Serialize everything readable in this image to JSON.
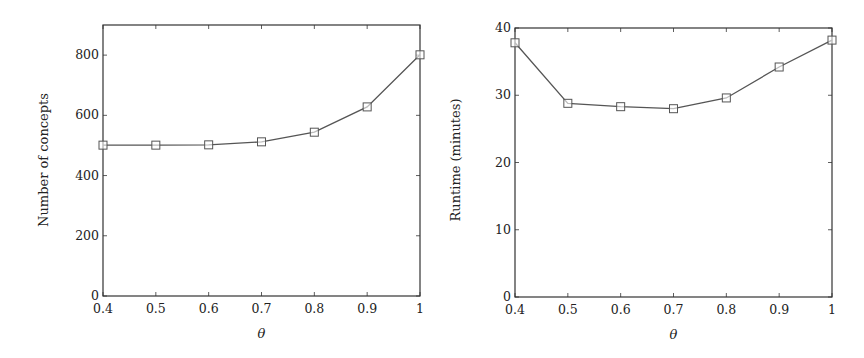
{
  "chart_data": [
    {
      "type": "line",
      "title": "",
      "xlabel": "θ",
      "ylabel": "Number of concepts",
      "x": [
        0.4,
        0.5,
        0.6,
        0.7,
        0.8,
        0.9,
        1.0
      ],
      "series": [
        {
          "name": "Number of concepts",
          "marker": "square",
          "values": [
            501,
            501,
            502,
            512,
            544,
            628,
            801
          ]
        }
      ],
      "xlim": [
        0.4,
        1.0
      ],
      "ylim": [
        0,
        900
      ],
      "xticks": [
        "0.4",
        "0.5",
        "0.6",
        "0.7",
        "0.8",
        "0.9",
        "1"
      ],
      "yticks": [
        "0",
        "200",
        "400",
        "600",
        "800"
      ],
      "ytick_values": [
        0,
        200,
        400,
        600,
        800
      ],
      "grid": false,
      "legend": null
    },
    {
      "type": "line",
      "title": "",
      "xlabel": "θ",
      "ylabel": "Runtime (minutes)",
      "x": [
        0.4,
        0.5,
        0.6,
        0.7,
        0.8,
        0.9,
        1.0
      ],
      "series": [
        {
          "name": "Runtime",
          "marker": "square",
          "values": [
            37.8,
            28.8,
            28.3,
            28.0,
            29.6,
            34.2,
            38.2
          ]
        }
      ],
      "xlim": [
        0.4,
        1.0
      ],
      "ylim": [
        0,
        40
      ],
      "xticks": [
        "0.4",
        "0.5",
        "0.6",
        "0.7",
        "0.8",
        "0.9",
        "1"
      ],
      "yticks": [
        "0",
        "10",
        "20",
        "30",
        "40"
      ],
      "ytick_values": [
        0,
        10,
        20,
        30,
        40
      ],
      "grid": false,
      "legend": null
    }
  ],
  "colors": {
    "line": "#555555",
    "axis": "#333333",
    "text": "#222222"
  }
}
